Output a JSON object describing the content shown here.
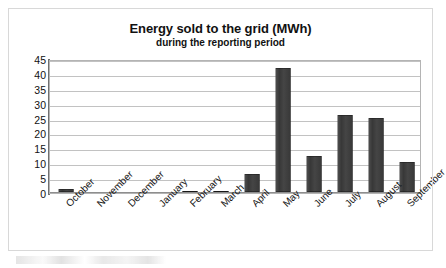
{
  "chart_data": {
    "type": "bar",
    "title": "Energy sold to the grid (MWh)",
    "subtitle": "during the reporting period",
    "xlabel": "",
    "ylabel": "",
    "categories": [
      "October",
      "November",
      "December",
      "January",
      "February",
      "March",
      "April",
      "May",
      "June",
      "July",
      "August",
      "September"
    ],
    "values": [
      1,
      0,
      0,
      0,
      0.3,
      0.5,
      6,
      41.5,
      12,
      26,
      25,
      10
    ],
    "ylim": [
      0,
      45
    ],
    "yticks": [
      0,
      5,
      10,
      15,
      20,
      25,
      30,
      35,
      40,
      45
    ],
    "ytick_labels": [
      "0",
      "5",
      "10",
      "15",
      "20",
      "25",
      "30",
      "35",
      "40",
      "45"
    ],
    "grid": true,
    "legend": false,
    "series": [
      {
        "name": "Energy sold (MWh)",
        "values": [
          1,
          0,
          0,
          0,
          0.3,
          0.5,
          6,
          41.5,
          12,
          26,
          25,
          10
        ]
      }
    ],
    "colors": {
      "bar": "#3b3b3b",
      "gridline": "#c2c2c2",
      "axis": "#707070",
      "text": "#111111",
      "frame": "#9a9a9a",
      "background": "#ffffff"
    }
  }
}
